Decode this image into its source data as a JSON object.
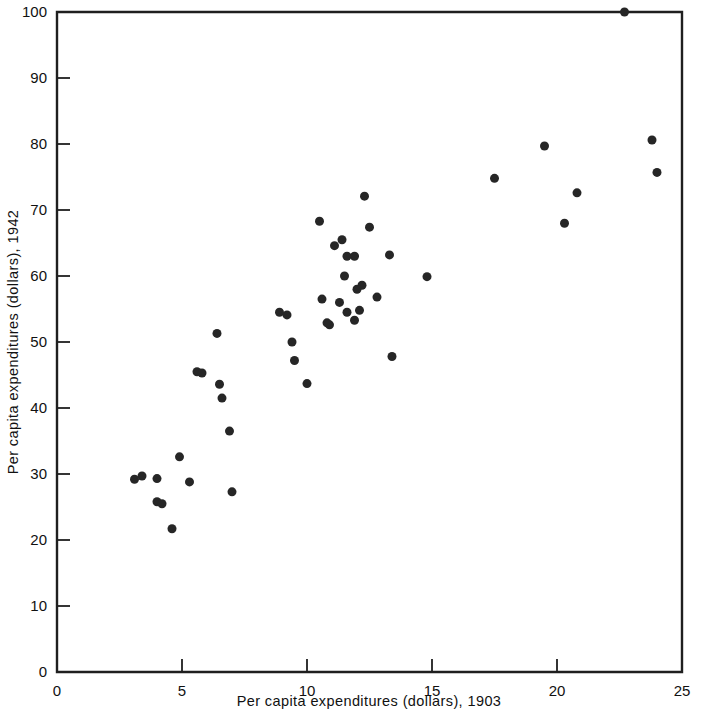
{
  "chart_data": {
    "type": "scatter",
    "title": "",
    "xlabel": "Per capita expenditures (dollars), 1903",
    "ylabel": "Per capita expenditures (dollars), 1942",
    "xlim": [
      0,
      25
    ],
    "ylim": [
      0,
      100
    ],
    "xticks": [
      0,
      5,
      10,
      15,
      20,
      25
    ],
    "yticks": [
      0,
      10,
      20,
      30,
      40,
      50,
      60,
      70,
      80,
      90,
      100
    ],
    "xtick_labels": [
      "0",
      "5",
      "10",
      "15",
      "20",
      "25"
    ],
    "ytick_labels": [
      "0",
      "10",
      "20",
      "30",
      "40",
      "50",
      "60",
      "70",
      "80",
      "90",
      "100"
    ],
    "grid": false,
    "legend": null,
    "marker": "filled-circle",
    "marker_color": "#262626",
    "marker_size": 9,
    "n_points": 48,
    "points": [
      [
        3.1,
        29.2
      ],
      [
        3.4,
        29.7
      ],
      [
        4.0,
        29.3
      ],
      [
        4.0,
        25.8
      ],
      [
        4.2,
        25.5
      ],
      [
        4.6,
        21.7
      ],
      [
        4.9,
        32.6
      ],
      [
        5.3,
        28.8
      ],
      [
        5.6,
        45.5
      ],
      [
        5.8,
        45.3
      ],
      [
        6.4,
        51.3
      ],
      [
        6.5,
        43.6
      ],
      [
        6.6,
        41.5
      ],
      [
        6.9,
        36.5
      ],
      [
        7.0,
        27.3
      ],
      [
        8.9,
        54.5
      ],
      [
        9.2,
        54.1
      ],
      [
        9.4,
        50.0
      ],
      [
        9.5,
        47.2
      ],
      [
        10.0,
        43.7
      ],
      [
        10.5,
        68.3
      ],
      [
        10.6,
        56.5
      ],
      [
        10.9,
        52.6
      ],
      [
        11.1,
        64.6
      ],
      [
        11.4,
        65.5
      ],
      [
        11.5,
        60.0
      ],
      [
        11.6,
        63.0
      ],
      [
        11.6,
        54.5
      ],
      [
        11.9,
        63.0
      ],
      [
        11.9,
        53.3
      ],
      [
        12.1,
        54.8
      ],
      [
        12.2,
        58.6
      ],
      [
        12.3,
        72.1
      ],
      [
        12.5,
        67.4
      ],
      [
        12.8,
        56.8
      ],
      [
        13.3,
        63.2
      ],
      [
        13.4,
        47.8
      ],
      [
        14.8,
        59.9
      ],
      [
        17.5,
        74.8
      ],
      [
        19.5,
        79.7
      ],
      [
        20.3,
        68.0
      ],
      [
        20.8,
        72.6
      ],
      [
        22.7,
        100.0
      ],
      [
        23.8,
        80.6
      ],
      [
        24.0,
        75.7
      ],
      [
        11.3,
        56.0
      ],
      [
        12.0,
        58.0
      ],
      [
        10.8,
        52.9
      ]
    ]
  },
  "axes": {
    "x_title": "Per capita expenditures (dollars), 1903",
    "y_title": "Per capita expenditures (dollars), 1942"
  }
}
